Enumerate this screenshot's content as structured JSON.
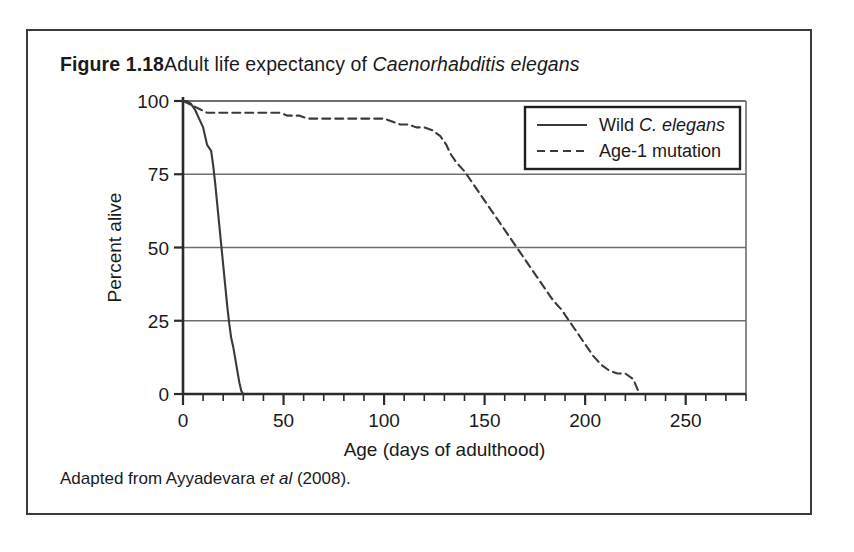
{
  "figure": {
    "label": "Figure 1.18",
    "title_rest": "Adult life expectancy of ",
    "title_species": "Caenorhabditis elegans",
    "caption_before": "Adapted from Ayyadevara ",
    "caption_italic": "et al",
    "caption_after": " (2008)."
  },
  "colors": {
    "frame": "#3b3b3b",
    "axis": "#2b2b2b",
    "grid": "#6e6e6e",
    "wild_line": "#3a3a3a",
    "age1_line": "#3a3a3a",
    "background": "#ffffff"
  },
  "legend": {
    "entry_wild_prefix": "Wild ",
    "entry_wild_species": "C. elegans",
    "entry_age1": "Age-1 mutation"
  },
  "chart_data": {
    "type": "line",
    "title": "Adult life expectancy of Caenorhabditis elegans",
    "xlabel": "Age (days of adulthood)",
    "ylabel": "Percent alive",
    "xlim": [
      0,
      280
    ],
    "ylim": [
      0,
      100
    ],
    "xticks": [
      0,
      50,
      100,
      150,
      200,
      250
    ],
    "xtick_labels": [
      "0",
      "50",
      "100",
      "150",
      "200",
      "250"
    ],
    "xminor_step": 10,
    "yticks": [
      0,
      25,
      50,
      75,
      100
    ],
    "ytick_labels": [
      "0",
      "25",
      "50",
      "75",
      "100"
    ],
    "grid": "horizontal",
    "legend_position": "upper right",
    "series": [
      {
        "name": "Wild C. elegans",
        "style": "solid",
        "x": [
          0,
          2,
          4,
          6,
          8,
          10,
          11,
          12,
          13,
          14,
          15,
          16,
          17,
          18,
          19,
          20,
          21,
          22,
          23,
          24,
          25,
          26,
          27,
          28,
          29,
          30
        ],
        "y": [
          100,
          100,
          99,
          97,
          94,
          91,
          88,
          85,
          84,
          83,
          78,
          72,
          65,
          58,
          51,
          44,
          37,
          30,
          24,
          19,
          16,
          12,
          8,
          4,
          1,
          0
        ]
      },
      {
        "name": "Age-1 mutation",
        "style": "dashed",
        "x": [
          0,
          3,
          6,
          9,
          12,
          20,
          30,
          40,
          48,
          52,
          58,
          62,
          70,
          80,
          90,
          100,
          104,
          108,
          112,
          116,
          120,
          124,
          128,
          131,
          133,
          136,
          140,
          144,
          148,
          152,
          156,
          160,
          164,
          168,
          172,
          176,
          180,
          184,
          188,
          192,
          196,
          200,
          204,
          208,
          212,
          216,
          220,
          224,
          227
        ],
        "y": [
          100,
          99,
          98,
          97,
          96,
          96,
          96,
          96,
          96,
          95,
          95,
          94,
          94,
          94,
          94,
          94,
          93,
          92,
          92,
          91,
          91,
          90,
          88,
          85,
          82,
          79,
          76,
          72,
          68,
          64,
          60,
          56,
          52,
          48,
          44,
          40,
          36,
          32,
          29,
          25,
          21,
          17,
          13,
          10,
          8,
          7,
          7,
          5,
          0
        ]
      }
    ]
  }
}
